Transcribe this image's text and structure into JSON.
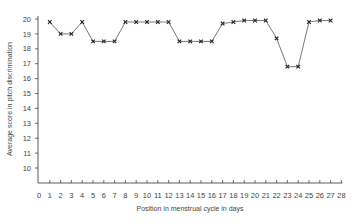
{
  "chart_data": {
    "type": "line",
    "title": "",
    "xlabel": "Position in menstrual cycle in days",
    "ylabel": "Average score in pitch discrimination",
    "xlim": [
      0,
      28
    ],
    "ylim": [
      9,
      20
    ],
    "x_ticks": [
      0,
      1,
      2,
      3,
      4,
      5,
      6,
      7,
      8,
      9,
      10,
      11,
      12,
      13,
      14,
      15,
      16,
      17,
      18,
      19,
      20,
      21,
      22,
      23,
      24,
      25,
      26,
      27,
      28
    ],
    "y_ticks": [
      10,
      11,
      12,
      13,
      14,
      15,
      16,
      17,
      18,
      19,
      20
    ],
    "grid": false,
    "legend": null,
    "marker": "x",
    "series": [
      {
        "name": "Average score",
        "x": [
          1,
          2,
          3,
          4,
          5,
          6,
          7,
          8,
          9,
          10,
          11,
          12,
          13,
          14,
          15,
          16,
          17,
          18,
          19,
          20,
          21,
          22,
          23,
          24,
          25,
          26,
          27
        ],
        "values": [
          19.8,
          19.0,
          19.0,
          19.8,
          18.5,
          18.5,
          18.5,
          19.8,
          19.8,
          19.8,
          19.8,
          19.8,
          18.5,
          18.5,
          18.5,
          18.5,
          19.7,
          19.8,
          19.9,
          19.9,
          19.9,
          18.7,
          16.8,
          16.8,
          19.8,
          19.9,
          19.9
        ]
      }
    ]
  }
}
